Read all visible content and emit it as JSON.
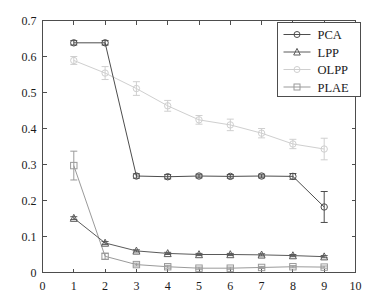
{
  "chart_data": {
    "type": "line",
    "title": "",
    "xlabel": "",
    "ylabel": "",
    "xlim": [
      0,
      10
    ],
    "ylim": [
      0,
      0.7
    ],
    "xticks": [
      0,
      1,
      2,
      3,
      4,
      5,
      6,
      7,
      8,
      9,
      10
    ],
    "xtick_labels": [
      "0",
      "1",
      "2",
      "3",
      "4",
      "5",
      "6",
      "7",
      "8",
      "9",
      "10"
    ],
    "yticks": [
      0,
      0.1,
      0.2,
      0.3,
      0.4,
      0.5,
      0.6,
      0.7
    ],
    "ytick_labels": [
      "0",
      "0.1",
      "0.2",
      "0.3",
      "0.4",
      "0.5",
      "0.6",
      "0.7"
    ],
    "grid": false,
    "legend_position": "top-right",
    "error_bars": true,
    "x": [
      1,
      2,
      3,
      4,
      5,
      6,
      7,
      8,
      9
    ],
    "series": [
      {
        "name": "PCA",
        "marker": "circle",
        "color": "#4d4d4d",
        "values": [
          0.638,
          0.638,
          0.268,
          0.266,
          0.268,
          0.267,
          0.268,
          0.267,
          0.182
        ],
        "errors": [
          0.006,
          0.006,
          0.006,
          0.006,
          0.005,
          0.005,
          0.005,
          0.008,
          0.043
        ]
      },
      {
        "name": "LPP",
        "marker": "triangle",
        "color": "#5a5a5a",
        "values": [
          0.151,
          0.082,
          0.06,
          0.053,
          0.05,
          0.05,
          0.049,
          0.047,
          0.044
        ],
        "errors": [
          0.004,
          0.004,
          0.003,
          0.003,
          0.003,
          0.003,
          0.003,
          0.003,
          0.003
        ]
      },
      {
        "name": "OLPP",
        "marker": "circle",
        "color": "#cfcfcf",
        "values": [
          0.589,
          0.554,
          0.511,
          0.463,
          0.424,
          0.41,
          0.387,
          0.357,
          0.343
        ],
        "errors": [
          0.011,
          0.018,
          0.019,
          0.015,
          0.012,
          0.016,
          0.013,
          0.013,
          0.03
        ]
      },
      {
        "name": "PLAE",
        "marker": "square",
        "color": "#9a9a9a",
        "values": [
          0.297,
          0.045,
          0.022,
          0.016,
          0.012,
          0.012,
          0.014,
          0.016,
          0.015
        ]
      }
    ],
    "legend": [
      {
        "label": "PCA",
        "marker": "circle",
        "color": "#4d4d4d"
      },
      {
        "label": "LPP",
        "marker": "triangle",
        "color": "#5a5a5a"
      },
      {
        "label": "OLPP",
        "marker": "circle",
        "color": "#cfcfcf"
      },
      {
        "label": "PLAE",
        "marker": "square",
        "color": "#9a9a9a"
      }
    ]
  },
  "plae_errors": [
    0.04,
    0.008,
    0.004,
    0.004,
    0.003,
    0.003,
    0.003,
    0.003,
    0.003
  ]
}
